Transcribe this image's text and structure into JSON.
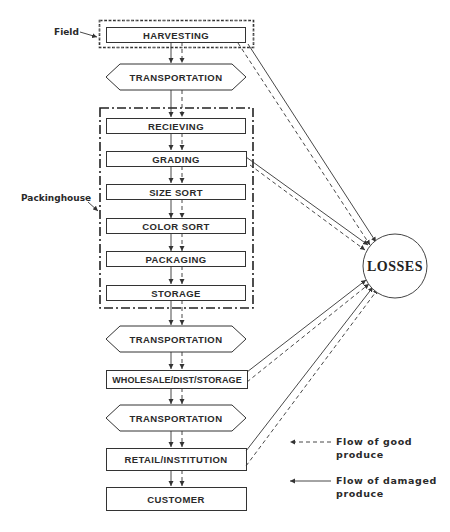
{
  "diagram": {
    "labels": {
      "field": "Field",
      "packinghouse": "Packinghouse"
    },
    "stages": [
      {
        "id": "harvesting",
        "label": "HARVESTING",
        "shape": "rect",
        "group": "field"
      },
      {
        "id": "transport1",
        "label": "TRANSPORTATION",
        "shape": "hexagon"
      },
      {
        "id": "receiving",
        "label": "RECIEVING",
        "shape": "rect",
        "group": "packinghouse"
      },
      {
        "id": "grading",
        "label": "GRADING",
        "shape": "rect",
        "group": "packinghouse"
      },
      {
        "id": "size_sort",
        "label": "SIZE SORT",
        "shape": "rect",
        "group": "packinghouse"
      },
      {
        "id": "color_sort",
        "label": "COLOR SORT",
        "shape": "rect",
        "group": "packinghouse"
      },
      {
        "id": "packaging",
        "label": "PACKAGING",
        "shape": "rect",
        "group": "packinghouse"
      },
      {
        "id": "storage",
        "label": "STORAGE",
        "shape": "rect",
        "group": "packinghouse"
      },
      {
        "id": "transport2",
        "label": "TRANSPORTATION",
        "shape": "hexagon"
      },
      {
        "id": "wholesale",
        "label": "WHOLESALE/DIST/STORAGE",
        "shape": "rect"
      },
      {
        "id": "transport3",
        "label": "TRANSPORTATION",
        "shape": "hexagon"
      },
      {
        "id": "retail",
        "label": "RETAIL/INSTITUTION",
        "shape": "rect"
      },
      {
        "id": "customer",
        "label": "CUSTOMER",
        "shape": "rect"
      }
    ],
    "sink": {
      "id": "losses",
      "label": "LOSSES",
      "shape": "circle"
    },
    "loss_sources": [
      "harvesting",
      "grading",
      "wholesale",
      "retail"
    ],
    "legend": [
      {
        "style": "dashed",
        "line1": "Flow of good",
        "line2": "produce"
      },
      {
        "style": "solid",
        "line1": "Flow of damaged",
        "line2": "produce"
      }
    ]
  }
}
